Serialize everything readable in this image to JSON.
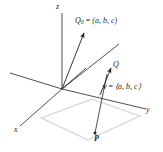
{
  "figure": {
    "type": "3d-coordinate-diagram",
    "background_color": "#ffffff",
    "line_color": "#231f20",
    "plane_color": "#d9d9d9"
  },
  "axes": {
    "x_label": "x",
    "y_label": "y",
    "z_label": "z"
  },
  "labels": {
    "q0_name": "Q",
    "q0_subscript": "0",
    "q0_equals": " = ",
    "q0_value": "(a, b, c)",
    "q_name": "Q",
    "p_name": "P",
    "v_name": "v",
    "v_equals": " = ",
    "v_value": "⟨a, b, c⟩"
  },
  "geometry": {
    "origin": [
      62,
      89
    ],
    "z_axis_tip": [
      62,
      12
    ],
    "x_axis_tip": [
      20,
      126
    ],
    "y_axis_tip": [
      146,
      109
    ],
    "y_axis_neg_tip": [
      10,
      73
    ],
    "q0_arrow_tip": [
      85,
      30
    ],
    "q_arrow_tip": [
      112,
      66
    ],
    "p_point": [
      95,
      133
    ],
    "parallel_line_tip": [
      119,
      44
    ],
    "plane_polygon": "41,118 88,140 140,116 92,99"
  }
}
